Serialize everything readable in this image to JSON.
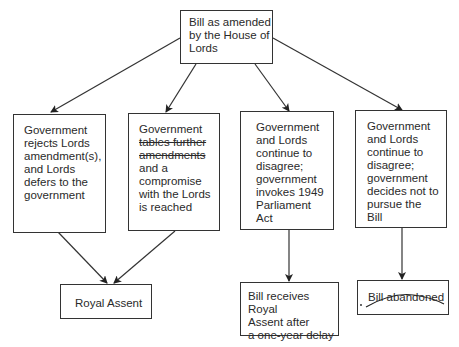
{
  "diagram": {
    "type": "flowchart",
    "root": {
      "id": "root",
      "lines": [
        "Bill as amended",
        "by the House of",
        "Lords"
      ]
    },
    "options": [
      {
        "id": "opt1",
        "lines": [
          "Government",
          "rejects Lords",
          "amendment(s),",
          "and Lords",
          "defers to the",
          "government"
        ]
      },
      {
        "id": "opt2",
        "lines": [
          "Government",
          "tables further",
          "amendments",
          "and a",
          "compromise",
          "with the Lords",
          "is reached"
        ],
        "struck_through_lines": [
          1,
          2
        ]
      },
      {
        "id": "opt3",
        "lines": [
          "Government",
          "and Lords",
          "continue to",
          "disagree;",
          "government",
          "invokes 1949",
          "Parliament",
          "Act"
        ]
      },
      {
        "id": "opt4",
        "lines": [
          "Government",
          "and Lords",
          "continue to",
          "disagree;",
          "government",
          "decides not to",
          "pursue the",
          "Bill"
        ]
      }
    ],
    "outcomes": [
      {
        "id": "out1",
        "lines": [
          "Royal Assent"
        ],
        "handwritten_underline": true
      },
      {
        "id": "out2",
        "lines": [
          "Bill receives Royal",
          "Assent after",
          "a one-year delay"
        ]
      },
      {
        "id": "out3",
        "lines": [
          "Bill abandoned"
        ],
        "handwritten_strike": true
      }
    ],
    "edges": [
      [
        "root",
        "opt1"
      ],
      [
        "root",
        "opt2"
      ],
      [
        "root",
        "opt3"
      ],
      [
        "root",
        "opt4"
      ],
      [
        "opt1",
        "out1"
      ],
      [
        "opt2",
        "out1"
      ],
      [
        "opt3",
        "out2"
      ],
      [
        "opt4",
        "out3"
      ]
    ]
  }
}
